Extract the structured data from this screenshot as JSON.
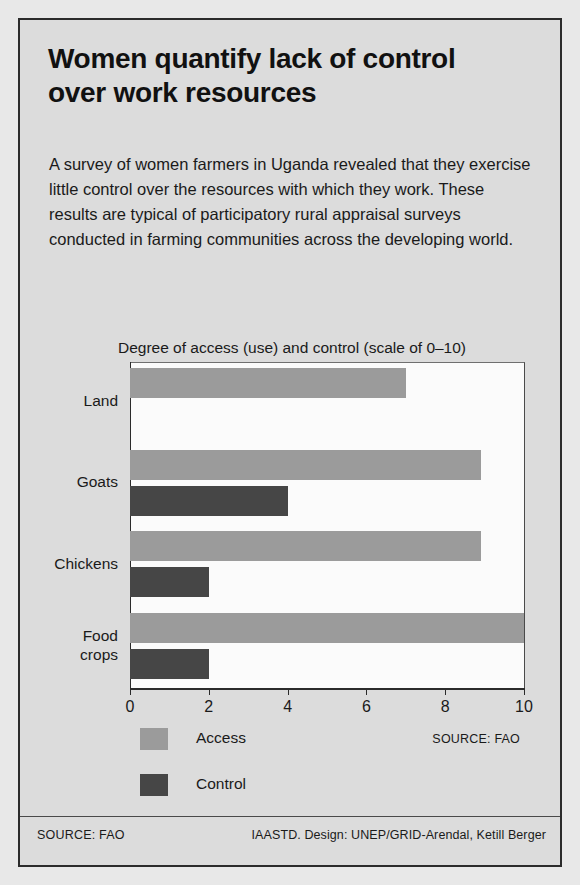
{
  "poster": {
    "headline": "Women quantify lack of control over work resources",
    "standfirst": "A survey of women farmers in Uganda revealed that they exercise little control over the resources with which they work. These results are typical of participatory rural appraisal surveys conducted in farming communities across the developing world."
  },
  "footer": {
    "left": "SOURCE: FAO",
    "right": "IAASTD. Design: UNEP/GRID-Arendal, Ketill Berger"
  },
  "chart": {
    "source_note": "SOURCE: FAO",
    "legend": [
      {
        "label": "Access",
        "color": "#9b9b9b"
      },
      {
        "label": "Control",
        "color": "#464646"
      }
    ]
  },
  "chart_data": {
    "type": "bar",
    "orientation": "horizontal",
    "title": "Degree of access (use) and control (scale of 0–10)",
    "xlabel": "",
    "ylabel": "",
    "xlim": [
      0,
      10
    ],
    "xticks": [
      0,
      2,
      4,
      6,
      8,
      10
    ],
    "xticklabels": [
      "0",
      "2",
      "4",
      "6",
      "8",
      "10"
    ],
    "grid": false,
    "legend_position": "bottom-left",
    "categories": [
      "Land",
      "Goats",
      "Chickens",
      "Food\ncrops"
    ],
    "series": [
      {
        "name": "Access",
        "color": "#9b9b9b",
        "values": [
          7,
          8.9,
          8.9,
          10
        ]
      },
      {
        "name": "Control",
        "color": "#464646",
        "values": [
          0,
          4,
          2,
          2
        ]
      }
    ]
  }
}
